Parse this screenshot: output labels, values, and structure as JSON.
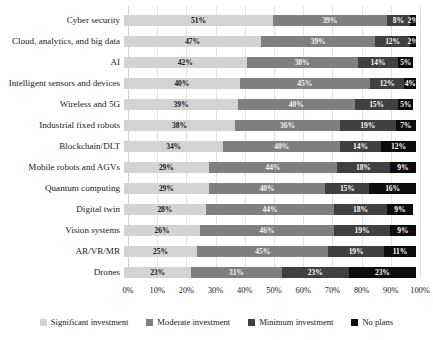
{
  "chart_data": {
    "type": "bar",
    "subtype": "stacked-horizontal-100",
    "title": "",
    "subtitle": "",
    "xlabel": "",
    "ylabel": "",
    "xlim": [
      0,
      100
    ],
    "grid": true,
    "legend_position": "bottom",
    "xticks": [
      "0%",
      "10%",
      "20%",
      "30%",
      "40%",
      "50%",
      "60%",
      "70%",
      "80%",
      "90%",
      "100%"
    ],
    "xtick_values": [
      0,
      10,
      20,
      30,
      40,
      50,
      60,
      70,
      80,
      90,
      100
    ],
    "categories": [
      "Cyber security",
      "Cloud, analytics, and big data",
      "AI",
      "Intelligent sensors and devices",
      "Wireless and 5G",
      "Industrial fixed robots",
      "Blockchain/DLT",
      "Mobile robots and AGVs",
      "Quantum computing",
      "Digital twin",
      "Vision systems",
      "AR/VR/MR",
      "Drones"
    ],
    "series": [
      {
        "name": "Significant investment",
        "color": "#d3d3d3",
        "values": [
          51,
          47,
          42,
          40,
          39,
          38,
          34,
          29,
          29,
          28,
          26,
          25,
          23
        ],
        "labels": [
          "51%",
          "47%",
          "42%",
          "40%",
          "39%",
          "38%",
          "34%",
          "29%",
          "29%",
          "28%",
          "26%",
          "25%",
          "23%"
        ]
      },
      {
        "name": "Moderate investment",
        "color": "#7f7f7f",
        "values": [
          39,
          39,
          38,
          45,
          40,
          36,
          40,
          44,
          40,
          44,
          46,
          45,
          31
        ],
        "labels": [
          "39%",
          "39%",
          "38%",
          "45%",
          "40%",
          "36%",
          "40%",
          "44%",
          "40%",
          "44%",
          "46%",
          "45%",
          "31%"
        ]
      },
      {
        "name": "Minimum investment",
        "color": "#404040",
        "values": [
          8,
          12,
          14,
          12,
          15,
          19,
          14,
          18,
          15,
          18,
          19,
          19,
          23
        ],
        "labels": [
          "8%",
          "12%",
          "14%",
          "12%",
          "15%",
          "19%",
          "14%",
          "18%",
          "15%",
          "18%",
          "19%",
          "19%",
          "23%"
        ]
      },
      {
        "name": "No plans",
        "color": "#0d0d0d",
        "values": [
          2,
          2,
          5,
          4,
          5,
          7,
          12,
          9,
          16,
          9,
          9,
          11,
          23
        ],
        "labels": [
          "2%",
          "2%",
          "5%",
          "4%",
          "5%",
          "7%",
          "12%",
          "9%",
          "16%",
          "9%",
          "9%",
          "11%",
          "23%"
        ]
      }
    ]
  },
  "legend": {
    "items": [
      {
        "label": "Significant investment",
        "color": "#d3d3d3"
      },
      {
        "label": "Moderate investment",
        "color": "#7f7f7f"
      },
      {
        "label": "Minimum investment",
        "color": "#404040"
      },
      {
        "label": "No plans",
        "color": "#0d0d0d"
      }
    ]
  }
}
